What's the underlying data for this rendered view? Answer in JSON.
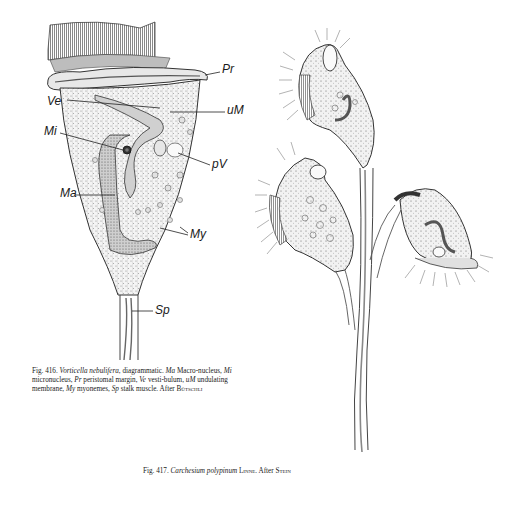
{
  "figure_416": {
    "number": "Fig. 416.",
    "species": "Vorticella nebulifera",
    "labels": {
      "Pr": "Pr",
      "Ve": "Ve",
      "uM": "uM",
      "Mi": "Mi",
      "pV": "pV",
      "Ma": "Ma",
      "My": "My",
      "Sp": "Sp"
    },
    "caption": {
      "prefix": "Fig. 416.",
      "species": "Vorticella nebulifera",
      "part1": ", diagrammatic. ",
      "ma": "Ma",
      "part2": " Macro-nucleus, ",
      "mi": "Mi",
      "part3": " micronucleus, ",
      "pr": "Pr",
      "part4": " peristomal margin, ",
      "ve": "Ve",
      "part5": " vesti-bulum, ",
      "um": "uM",
      "part6": " undulating membrane, ",
      "my": "My",
      "part7": " myonemes, ",
      "sp": "Sp",
      "part8": " stalk muscle. After ",
      "author": "Bütschli"
    }
  },
  "figure_417": {
    "caption": {
      "prefix": "Fig. 417.",
      "species": "Carchesium polypinum",
      "authority": "Linne",
      "after": ". After ",
      "author": "Stein"
    }
  }
}
